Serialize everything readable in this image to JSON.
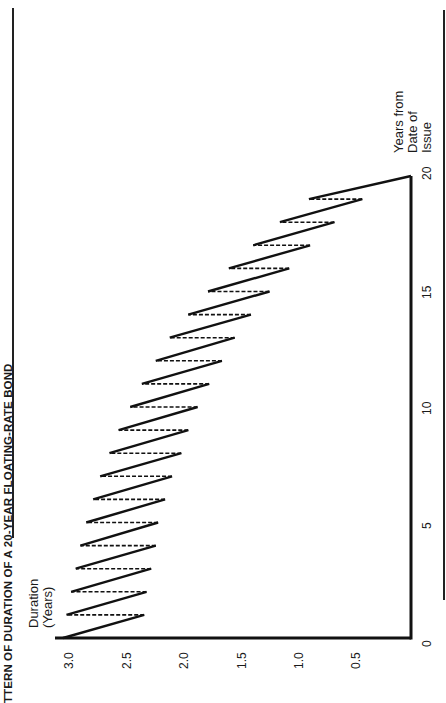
{
  "chart_data": {
    "type": "line",
    "title_visible": "TTERN OF DURATION OF A 20-YEAR FLOATING-RATE BOND",
    "xlabel": "Years from Date of Issue",
    "xlabel_lines": [
      "Years from",
      "Date of",
      "Issue"
    ],
    "ylabel": "Duration (Years)",
    "ylabel_lines": [
      "Duration",
      "(Years)"
    ],
    "orientation": "rotated 90° counter-clockwise",
    "xlim": [
      0,
      20
    ],
    "ylim": [
      0,
      3.0
    ],
    "x_ticks": [
      "0",
      "5",
      "10",
      "15",
      "20"
    ],
    "y_ticks": [
      "3.0",
      "2.5",
      "2.0",
      "1.5",
      "1.0",
      "0.5"
    ],
    "grid": false,
    "legend": null,
    "series": [
      {
        "name": "Duration (sawtooth, solid = decay between resets, dashed = reset jump)",
        "start": {
          "year": 0,
          "duration": 3.0
        },
        "end": {
          "year": 20,
          "duration": 0.0
        },
        "resets": [
          {
            "year": 1,
            "before": 2.3,
            "after": 2.97
          },
          {
            "year": 2,
            "before": 2.28,
            "after": 2.93
          },
          {
            "year": 3,
            "before": 2.24,
            "after": 2.89
          },
          {
            "year": 4,
            "before": 2.2,
            "after": 2.85
          },
          {
            "year": 5,
            "before": 2.18,
            "after": 2.8
          },
          {
            "year": 6,
            "before": 2.12,
            "after": 2.74
          },
          {
            "year": 7,
            "before": 2.06,
            "after": 2.68
          },
          {
            "year": 8,
            "before": 1.98,
            "after": 2.6
          },
          {
            "year": 9,
            "before": 1.92,
            "after": 2.52
          },
          {
            "year": 10,
            "before": 1.84,
            "after": 2.42
          },
          {
            "year": 11,
            "before": 1.74,
            "after": 2.32
          },
          {
            "year": 12,
            "before": 1.63,
            "after": 2.2
          },
          {
            "year": 13,
            "before": 1.52,
            "after": 2.08
          },
          {
            "year": 14,
            "before": 1.38,
            "after": 1.92
          },
          {
            "year": 15,
            "before": 1.22,
            "after": 1.75
          },
          {
            "year": 16,
            "before": 1.05,
            "after": 1.57
          },
          {
            "year": 17,
            "before": 0.87,
            "after": 1.36
          },
          {
            "year": 18,
            "before": 0.66,
            "after": 1.13
          },
          {
            "year": 19,
            "before": 0.42,
            "after": 0.88
          }
        ]
      }
    ]
  }
}
